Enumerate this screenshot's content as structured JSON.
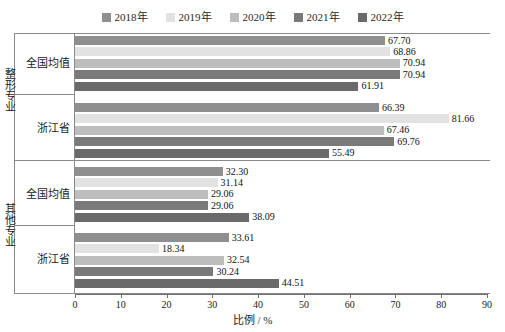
{
  "legend": {
    "items": [
      {
        "label": "2018年",
        "color": "#8f8f8f"
      },
      {
        "label": "2019年",
        "color": "#e2e2e2"
      },
      {
        "label": "2020年",
        "color": "#bdbdbd"
      },
      {
        "label": "2021年",
        "color": "#7a7a7a"
      },
      {
        "label": "2022年",
        "color": "#6a6a6a"
      }
    ]
  },
  "sections": [
    {
      "label": "整形专业"
    },
    {
      "label": "其他专业"
    }
  ],
  "groups": [
    {
      "label": "全国均值",
      "section": "整形专业"
    },
    {
      "label": "浙江省",
      "section": "整形专业"
    },
    {
      "label": "全国均值",
      "section": "其他专业"
    },
    {
      "label": "浙江省",
      "section": "其他专业"
    }
  ],
  "axis": {
    "title": "比例 / %",
    "ticks": [
      "0",
      "10",
      "20",
      "30",
      "40",
      "50",
      "60",
      "70",
      "80",
      "90"
    ],
    "min": 0,
    "max": 90
  },
  "chart_data": {
    "type": "bar",
    "orientation": "horizontal",
    "title": "",
    "xlabel": "比例 / %",
    "ylabel": "",
    "xlim": [
      0,
      90
    ],
    "grid": false,
    "legend_position": "top",
    "categories": [
      "整形专业 - 全国均值",
      "整形专业 - 浙江省",
      "其他专业 - 全国均值",
      "其他专业 - 浙江省"
    ],
    "series": [
      {
        "name": "2018年",
        "color": "#8f8f8f",
        "values": [
          67.7,
          66.39,
          32.3,
          33.61
        ]
      },
      {
        "name": "2019年",
        "color": "#e2e2e2",
        "values": [
          68.86,
          81.66,
          31.14,
          18.34
        ]
      },
      {
        "name": "2020年",
        "color": "#bdbdbd",
        "values": [
          70.94,
          67.46,
          29.06,
          32.54
        ]
      },
      {
        "name": "2021年",
        "color": "#7a7a7a",
        "values": [
          70.94,
          69.76,
          29.06,
          30.24
        ]
      },
      {
        "name": "2022年",
        "color": "#6a6a6a",
        "values": [
          61.91,
          55.49,
          38.09,
          44.51
        ]
      }
    ],
    "data_labels": [
      [
        "67.70",
        "68.86",
        "70.94",
        "70.94",
        "61.91"
      ],
      [
        "66.39",
        "81.66",
        "67.46",
        "69.76",
        "55.49"
      ],
      [
        "32.30",
        "31.14",
        "29.06",
        "29.06",
        "38.09"
      ],
      [
        "33.61",
        "18.34",
        "32.54",
        "30.24",
        "44.51"
      ]
    ]
  }
}
